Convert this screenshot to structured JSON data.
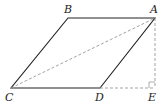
{
  "diagram": {
    "type": "geometry",
    "colors": {
      "solid": "#222222",
      "dashed": "#999999"
    },
    "points": {
      "A": {
        "label": "A",
        "x": 155,
        "y": 18
      },
      "B": {
        "label": "B",
        "x": 68,
        "y": 18
      },
      "C": {
        "label": "C",
        "x": 11,
        "y": 88
      },
      "D": {
        "label": "D",
        "x": 100,
        "y": 88
      },
      "E": {
        "label": "E",
        "x": 155,
        "y": 88
      }
    },
    "solid_segments": [
      "BA",
      "AD",
      "DC",
      "CB"
    ],
    "dashed_segments": [
      "CA",
      "AE",
      "DE"
    ],
    "right_angle_at": "E"
  }
}
